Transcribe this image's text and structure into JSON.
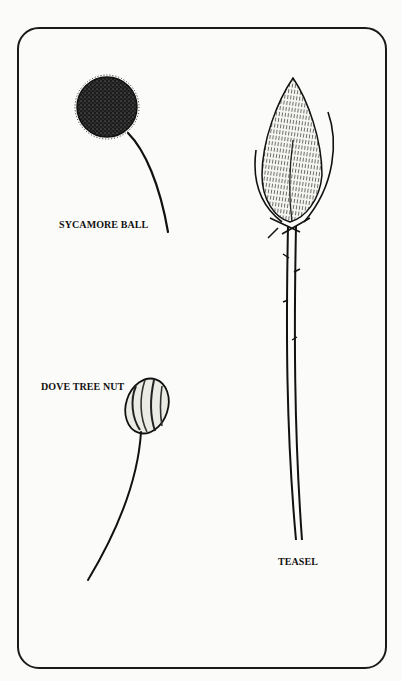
{
  "illustration": {
    "frame": {
      "stroke": "#1a1a1a",
      "background": "#fbfbf9"
    },
    "specimens": [
      {
        "id": "sycamore",
        "label": "SYCAMORE BALL",
        "icon": "sycamore-ball-drawing"
      },
      {
        "id": "dove",
        "label": "DOVE TREE NUT",
        "icon": "dove-tree-nut-drawing"
      },
      {
        "id": "teasel",
        "label": "TEASEL",
        "icon": "teasel-drawing"
      }
    ]
  }
}
